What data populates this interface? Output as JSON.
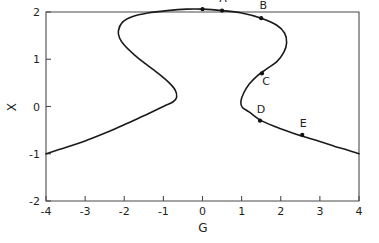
{
  "chart_data": {
    "type": "line",
    "title": "",
    "xlabel": "G",
    "ylabel": "X",
    "xlim": [
      -4,
      4
    ],
    "ylim": [
      -2,
      2
    ],
    "grid": false,
    "legend": null,
    "x_ticks": [
      "-4",
      "-3",
      "-2",
      "-1",
      "0",
      "1",
      "2",
      "3",
      "4"
    ],
    "x_tick_values": [
      -4,
      -3,
      -2,
      -1,
      0,
      1,
      2,
      3,
      4
    ],
    "y_ticks": [
      "-2",
      "-1",
      "0",
      "1",
      "2"
    ],
    "y_tick_values": [
      -2,
      -1,
      0,
      1,
      2
    ],
    "series": [
      {
        "name": "equilibrium-curve",
        "comment": "S-shaped hysteresis / cusp bifurcation curve, traced as a single continuous path parameterized along the fold",
        "x": [
          -4.0,
          -3.5,
          -3.0,
          -2.6,
          -2.2,
          -1.8,
          -1.4,
          -1.0,
          -0.75,
          -0.66,
          -0.7,
          -0.85,
          -1.1,
          -1.45,
          -1.75,
          -2.0,
          -2.12,
          -2.15,
          -2.05,
          -1.8,
          -1.4,
          -0.9,
          -0.4,
          0.0,
          0.5,
          1.0,
          1.5,
          1.9,
          2.1,
          2.15,
          2.08,
          1.9,
          1.65,
          1.4,
          1.2,
          1.05,
          0.98,
          1.02,
          1.2,
          1.5,
          1.9,
          2.3,
          2.6,
          3.0,
          3.4,
          3.7,
          4.0
        ],
        "y": [
          -1.0,
          -0.87,
          -0.73,
          -0.6,
          -0.46,
          -0.31,
          -0.16,
          0.0,
          0.1,
          0.2,
          0.35,
          0.5,
          0.68,
          0.9,
          1.1,
          1.3,
          1.45,
          1.6,
          1.78,
          1.9,
          1.98,
          2.03,
          2.06,
          2.06,
          2.03,
          1.98,
          1.87,
          1.72,
          1.55,
          1.35,
          1.15,
          0.95,
          0.8,
          0.65,
          0.48,
          0.28,
          0.1,
          -0.02,
          -0.12,
          -0.3,
          -0.44,
          -0.56,
          -0.64,
          -0.74,
          -0.85,
          -0.92,
          -1.0
        ]
      }
    ],
    "annotations": [
      {
        "label": "H",
        "x": 0.0,
        "y": 2.06,
        "label_dx": 0,
        "label_dy": -9
      },
      {
        "label": "A",
        "x": 0.5,
        "y": 2.03,
        "label_dx": 1,
        "label_dy": -9
      },
      {
        "label": "B",
        "x": 1.5,
        "y": 1.87,
        "label_dx": 2,
        "label_dy": -9
      },
      {
        "label": "C",
        "x": 1.52,
        "y": 0.7,
        "label_dx": 4,
        "label_dy": 12
      },
      {
        "label": "D",
        "x": 1.47,
        "y": -0.3,
        "label_dx": 1,
        "label_dy": -8
      },
      {
        "label": "E",
        "x": 2.55,
        "y": -0.6,
        "label_dx": 1,
        "label_dy": -8
      }
    ]
  },
  "colors": {
    "curve": "#1a1a1a",
    "axis": "#4a4a4a",
    "text": "#231f20",
    "background": "#ffffff",
    "marker": "#111111"
  }
}
